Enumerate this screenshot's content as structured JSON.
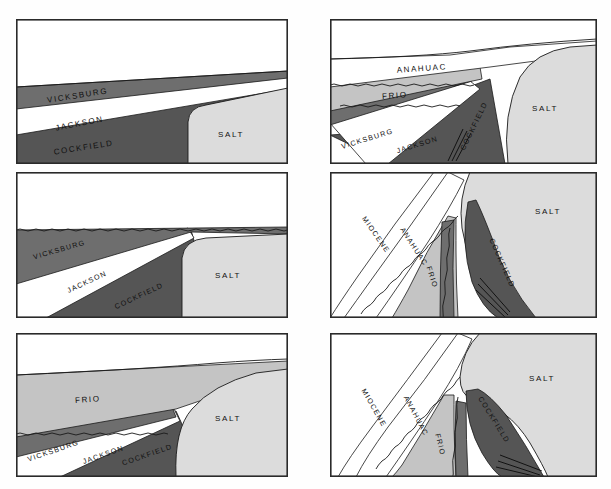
{
  "figure": {
    "panel_count": 6,
    "columns": 2,
    "rows": 3
  },
  "colors": {
    "background": "#fefefe",
    "panel_fill": "#ffffff",
    "border": "#2a2a2a",
    "salt": "#dcdcdc",
    "frio": "#c4c4c4",
    "vicksburg": "#6e6e6e",
    "jackson": "#ffffff",
    "cockfield": "#555555",
    "anahuac": "#ffffff",
    "miocene": "#ffffff",
    "line": "#1a1a1a",
    "text": "#111111"
  },
  "units": {
    "salt": "SALT",
    "frio": "FRIO",
    "vicksburg": "VICKSBURG",
    "jackson": "JACKSON",
    "cockfield": "COCKFIELD",
    "anahuac": "ANAHUAC",
    "miocene": "MIOCENE"
  },
  "panels": [
    {
      "id": "panel-1",
      "position": "top-left",
      "stage": 1,
      "labels": [
        {
          "unit": "vicksburg",
          "text": "VICKSBURG",
          "x": 62,
          "y": 79,
          "rotate": -9
        },
        {
          "unit": "jackson",
          "text": "JACKSON",
          "x": 64,
          "y": 107,
          "rotate": -11
        },
        {
          "unit": "cockfield",
          "text": "COCKFIELD",
          "x": 65,
          "y": 131,
          "rotate": -9
        },
        {
          "unit": "salt",
          "text": "SALT",
          "x": 205,
          "y": 118,
          "rotate": 0
        }
      ]
    },
    {
      "id": "panel-2",
      "position": "top-right",
      "stage": 2,
      "labels": [
        {
          "unit": "anahuac",
          "text": "ANAHUAC",
          "x": 48,
          "y": 51,
          "rotate": -4
        },
        {
          "unit": "frio",
          "text": "FRIO",
          "x": 62,
          "y": 80,
          "rotate": -4
        },
        {
          "unit": "vicksburg",
          "text": "VICKSBURG",
          "x": 18,
          "y": 118,
          "rotate": -15
        },
        {
          "unit": "jackson",
          "text": "JACKSON",
          "x": 68,
          "y": 125,
          "rotate": -15
        },
        {
          "unit": "cockfield",
          "text": "COCKFIELD",
          "x": 145,
          "y": 92,
          "rotate": 64
        },
        {
          "unit": "salt",
          "text": "SALT",
          "x": 215,
          "y": 92,
          "rotate": 0
        }
      ]
    },
    {
      "id": "panel-3",
      "position": "middle-left",
      "stage": 3,
      "labels": [
        {
          "unit": "vicksburg",
          "text": "VICKSBURG",
          "x": 20,
          "y": 82,
          "rotate": -15
        },
        {
          "unit": "jackson",
          "text": "JACKSON",
          "x": 55,
          "y": 113,
          "rotate": -24
        },
        {
          "unit": "cockfield",
          "text": "COCKFIELD",
          "x": 105,
          "y": 128,
          "rotate": -23
        },
        {
          "unit": "salt",
          "text": "SALT",
          "x": 205,
          "y": 106,
          "rotate": 0
        }
      ]
    },
    {
      "id": "panel-4",
      "position": "middle-right",
      "stage": 4,
      "labels": [
        {
          "unit": "miocene",
          "text": "MIOCENE",
          "x": 35,
          "y": 62,
          "rotate": 54
        },
        {
          "unit": "anahuac",
          "text": "ANAHUAC",
          "x": 70,
          "y": 72,
          "rotate": 57
        },
        {
          "unit": "frio",
          "text": "FRIO",
          "x": 104,
          "y": 105,
          "rotate": 70
        },
        {
          "unit": "cockfield",
          "text": "COCKFIELD",
          "x": 168,
          "y": 88,
          "rotate": 66
        },
        {
          "unit": "salt",
          "text": "SALT",
          "x": 218,
          "y": 42,
          "rotate": 0
        }
      ]
    },
    {
      "id": "panel-5",
      "position": "bottom-left",
      "stage": 5,
      "labels": [
        {
          "unit": "frio",
          "text": "FRIO",
          "x": 70,
          "y": 69,
          "rotate": -4
        },
        {
          "unit": "vicksburg",
          "text": "VICKSBURG",
          "x": 16,
          "y": 119,
          "rotate": -18
        },
        {
          "unit": "jackson",
          "text": "JACKSON",
          "x": 70,
          "y": 126,
          "rotate": -18
        },
        {
          "unit": "cockfield",
          "text": "COCKFIELD",
          "x": 118,
          "y": 127,
          "rotate": -18
        },
        {
          "unit": "salt",
          "text": "SALT",
          "x": 208,
          "y": 90,
          "rotate": 0
        }
      ]
    },
    {
      "id": "panel-6",
      "position": "bottom-right",
      "stage": 6,
      "labels": [
        {
          "unit": "miocene",
          "text": "MIOCENE",
          "x": 34,
          "y": 74,
          "rotate": 60
        },
        {
          "unit": "anahuac",
          "text": "ANAHUAC",
          "x": 72,
          "y": 80,
          "rotate": 62
        },
        {
          "unit": "frio",
          "text": "FRIO",
          "x": 113,
          "y": 113,
          "rotate": 76
        },
        {
          "unit": "cockfield",
          "text": "COCKFIELD",
          "x": 156,
          "y": 84,
          "rotate": 58
        },
        {
          "unit": "salt",
          "text": "SALT",
          "x": 212,
          "y": 48,
          "rotate": 0
        }
      ]
    }
  ]
}
